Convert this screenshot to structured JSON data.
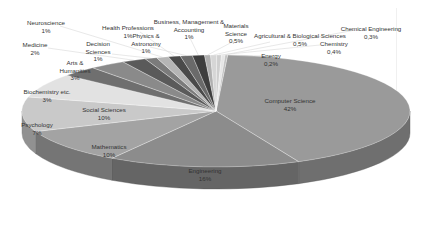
{
  "chart_data": {
    "type": "pie",
    "style": "3d-pie",
    "title": "",
    "legend": "none (data labels with leader lines)",
    "categories": [
      "Computer Science",
      "Engineering",
      "Mathematics",
      "Social Sciences",
      "Psychology",
      "Biochemistry etc.",
      "Arts & Humanities",
      "Medicine",
      "Decision Sciences",
      "Neuroscience",
      "Health Professions",
      "Physics & Astronomy",
      "Business, Management & Accounting",
      "Materials Science",
      "Agricultural & Biological Sciences",
      "Chemistry",
      "Chemical Engineering",
      "Energy"
    ],
    "values": [
      42,
      16,
      10,
      10,
      7,
      3,
      3,
      2,
      1,
      1,
      1,
      1,
      1,
      0.5,
      0.5,
      0.4,
      0.3,
      0.2
    ],
    "value_labels": [
      "42%",
      "16%",
      "10%",
      "10%",
      "7%",
      "3%",
      "3%",
      "2%",
      "1%",
      "1%",
      "1%",
      "1%",
      "1%",
      "0,5%",
      "0,5%",
      "0,4%",
      "0,3%",
      "0,2%"
    ],
    "colors": [
      "#9a9a9a",
      "#8c8c8c",
      "#a3a3a3",
      "#c9c9c9",
      "#e2e2e2",
      "#6f6f6f",
      "#8a8a8a",
      "#5a5a5a",
      "#7b7b7b",
      "#b5b5b5",
      "#4a4a4a",
      "#6a6a6a",
      "#3e3e3e",
      "#b0b0b0",
      "#d6d6d6",
      "#cfcfcf",
      "#e6e6e6",
      "#c0c0c0"
    ]
  },
  "labels": {
    "computer_science": {
      "name": "Computer Science",
      "pct": "42%"
    },
    "engineering": {
      "name": "Engineering",
      "pct": "16%"
    },
    "mathematics": {
      "name": "Mathematics",
      "pct": "10%"
    },
    "social_sciences": {
      "name": "Social Sciences",
      "pct": "10%"
    },
    "psychology": {
      "name": "Psychology",
      "pct": "7%"
    },
    "biochemistry": {
      "name": "Biochemistry etc.",
      "pct": "3%"
    },
    "arts1": "Arts &",
    "arts2": "Humanities",
    "arts_pct": "3%",
    "medicine": {
      "name": "Medicine",
      "pct": "2%"
    },
    "decision1": "Decision",
    "decision2": "Sciences",
    "decision_pct": "1%",
    "neuroscience": {
      "name": "Neuroscience",
      "pct": "1%"
    },
    "health": {
      "name": "Health Professions",
      "pct": "1%"
    },
    "physics1": "Physics &",
    "physics2": "Astronomy",
    "physics_pct": "1%",
    "business1": "Business, Management &",
    "business2": "Accounting",
    "business_pct": "1%",
    "materials1": "Materials",
    "materials2": "Science",
    "materials_pct": "0,5%",
    "agri": {
      "name": "Agricultural & Biological Sciences",
      "pct": "0,5%"
    },
    "chemistry": {
      "name": "Chemistry",
      "pct": "0,4%"
    },
    "chemeng": {
      "name": "Chemical Engineering",
      "pct": "0,3%"
    },
    "energy": {
      "name": "Energy",
      "pct": "0,2%"
    }
  }
}
